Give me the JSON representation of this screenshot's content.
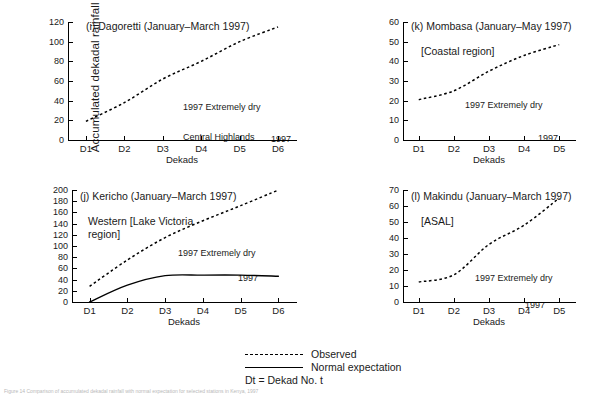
{
  "figure": {
    "ylabel": "Accumulated dekadal rainfall mm",
    "caption": "Figure 14 Comparison of accumulated dekadal rainfall with normal expectation for selected stations in Kenya, 1997"
  },
  "legend": {
    "observed_label": "Observed",
    "normal_label": "Normal expectation",
    "note": "Dt = Dekad No. t"
  },
  "chart_data": [
    {
      "type": "line",
      "panel_id": "i",
      "title": "(i) Dagoretti (January–March 1997)",
      "region_label": "Central Highlands",
      "annotation_dry": "1997 Extremely dry",
      "annotation_year": "1997",
      "xlabel": "Dekads",
      "ylabel": "",
      "categories": [
        "D1",
        "D2",
        "D3",
        "D4",
        "D5",
        "D6"
      ],
      "yticks": [
        0,
        20,
        40,
        60,
        80,
        100,
        120
      ],
      "ylim": [
        0,
        120
      ],
      "grid": false,
      "series": [
        {
          "name": "Observed",
          "style": "dashed",
          "values": [
            19,
            38,
            62,
            80,
            100,
            115
          ]
        }
      ]
    },
    {
      "type": "line",
      "panel_id": "k",
      "title": "(k) Mombasa (January–May 1997)",
      "region_label": "[Coastal region]",
      "annotation_dry": "1997 Extremely dry",
      "annotation_year": "1997",
      "xlabel": "Dekads",
      "ylabel": "",
      "categories": [
        "D1",
        "D2",
        "D3",
        "D4",
        "D5"
      ],
      "yticks": [
        0,
        10,
        20,
        30,
        40,
        50,
        60
      ],
      "ylim": [
        0,
        60
      ],
      "grid": false,
      "series": [
        {
          "name": "Observed",
          "style": "dashed",
          "values": [
            20.5,
            25,
            35,
            43,
            48.5
          ]
        }
      ]
    },
    {
      "type": "line",
      "panel_id": "j",
      "title": "(j) Kericho (January–March 1997)",
      "region_label": "Western [Lake Victoria",
      "region_label2": "region]",
      "annotation_dry": "1997 Extremely dry",
      "annotation_year": "1997",
      "xlabel": "Dekads",
      "ylabel": "",
      "categories": [
        "D1",
        "D2",
        "D3",
        "D4",
        "D5",
        "D6"
      ],
      "yticks": [
        0,
        20,
        40,
        60,
        80,
        100,
        120,
        140,
        160,
        180,
        200
      ],
      "ylim": [
        0,
        200
      ],
      "grid": false,
      "series": [
        {
          "name": "Observed",
          "style": "dashed",
          "values": [
            28,
            75,
            115,
            145,
            172,
            200
          ]
        },
        {
          "name": "Normal expectation",
          "style": "solid",
          "values": [
            0,
            30,
            47,
            48,
            48,
            46
          ]
        }
      ]
    },
    {
      "type": "line",
      "panel_id": "l",
      "title": "(l) Makindu (January–March 1997)",
      "region_label": "[ASAL]",
      "annotation_dry": "1997 Extremely dry",
      "annotation_year": "1997",
      "xlabel": "Dekads",
      "ylabel": "",
      "categories": [
        "D1",
        "D2",
        "D3",
        "D4",
        "D5"
      ],
      "yticks": [
        0,
        10,
        20,
        30,
        40,
        50,
        60,
        70
      ],
      "ylim": [
        0,
        70
      ],
      "grid": false,
      "series": [
        {
          "name": "Observed",
          "style": "dashed",
          "values": [
            12.5,
            17,
            36,
            48,
            65
          ]
        }
      ]
    }
  ]
}
